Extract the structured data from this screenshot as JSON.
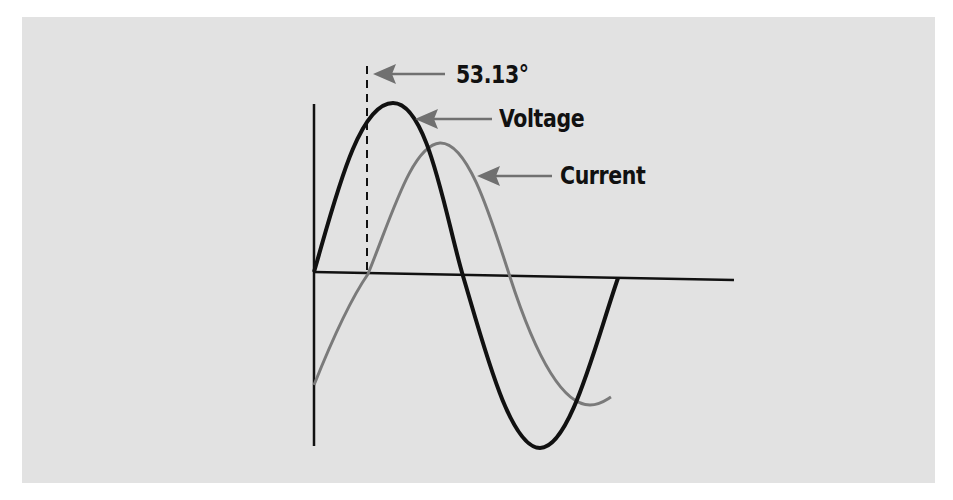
{
  "diagram": {
    "labels": {
      "angle": "53.13°",
      "voltage": "Voltage",
      "current": "Current"
    },
    "colors": {
      "background": "#e2e2e2",
      "voltage": "#111111",
      "current": "#7a7a7a",
      "arrow": "#707070",
      "axis": "#111111"
    },
    "phase_shift_degrees": 53.13
  }
}
